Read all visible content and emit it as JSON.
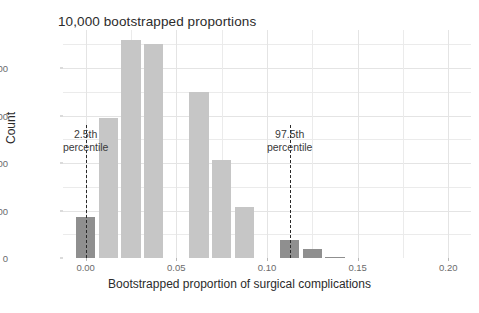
{
  "chart_data": {
    "type": "bar",
    "title": "10,000 bootstrapped proportions",
    "xlabel": "Bootstrapped proportion of surgical complications",
    "ylabel": "Count",
    "xlim": [
      -0.0125,
      0.2125
    ],
    "ylim": [
      0,
      2400
    ],
    "grid": true,
    "legend": "none",
    "bin_width": 0.0125,
    "categories": [
      0.0,
      0.0125,
      0.025,
      0.0375,
      0.05,
      0.0625,
      0.075,
      0.0875,
      0.1,
      0.1125,
      0.125,
      0.1375
    ],
    "values": [
      430,
      1470,
      2290,
      2250,
      0,
      1745,
      1030,
      535,
      0,
      185,
      90,
      15
    ],
    "bar_colors": [
      "tail",
      "fill",
      "fill",
      "fill",
      "fill",
      "fill",
      "fill",
      "fill",
      "fill",
      "tail",
      "tail",
      "tail"
    ],
    "xticks": [
      "0.00",
      "0.05",
      "0.10",
      "0.15",
      "0.20"
    ],
    "xtick_values": [
      0.0,
      0.05,
      0.1,
      0.15,
      0.2
    ],
    "yticks": [
      "0",
      "500",
      "1000",
      "1500",
      "2000"
    ],
    "ytick_values": [
      0,
      500,
      1000,
      1500,
      2000
    ],
    "annotations": [
      {
        "id": "lower",
        "line1": "2.5th",
        "line2": "percentile",
        "x": 0.0
      },
      {
        "id": "upper",
        "line1": "97.5th",
        "line2": "percentile",
        "x": 0.1125
      }
    ],
    "colors": {
      "bar_fill": "#c6c6c6",
      "bar_tail": "#8f8f8f",
      "grid": "#ebebeb",
      "text": "#2b2b2b",
      "tick_text": "#6b6b6b",
      "marker_line": "#2a2a2a",
      "background": "#ffffff"
    }
  }
}
